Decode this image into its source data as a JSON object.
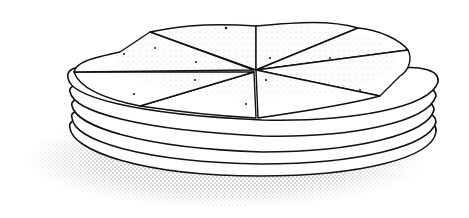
{
  "illustration": {
    "subject": "stack of tortillas",
    "style": "black ink stipple line drawing",
    "background_color": "#ffffff",
    "ink_color": "#111111",
    "tortilla_layers": 5,
    "top_tortilla_wedges": 8
  }
}
